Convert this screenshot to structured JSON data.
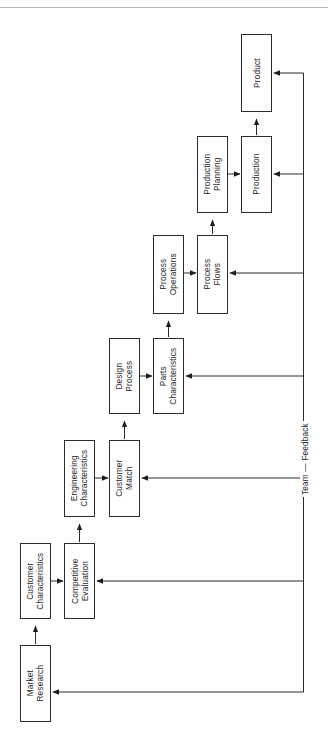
{
  "diagram": {
    "orientation": "rotated-90",
    "stroke_color": "#2b2b2b",
    "background_color": "#ffffff",
    "rule_color": "#b9b9b9",
    "nodes": [
      {
        "id": "market-research",
        "label": "Market\nResearch",
        "x": 20,
        "y": 645,
        "w": 31,
        "h": 77
      },
      {
        "id": "customer-characteristics",
        "label": "Customer\nCharacteristics",
        "x": 20,
        "y": 543,
        "w": 31,
        "h": 76
      },
      {
        "id": "competitive-evaluation",
        "label": "Competitive\nEvaluation",
        "x": 64,
        "y": 543,
        "w": 31,
        "h": 76
      },
      {
        "id": "engineering-characteristics",
        "label": "Engineering\nCharacteristics",
        "x": 64,
        "y": 440,
        "w": 31,
        "h": 77
      },
      {
        "id": "customer-match",
        "label": "Customer\nMatch",
        "x": 109,
        "y": 440,
        "w": 31,
        "h": 77
      },
      {
        "id": "design-process",
        "label": "Design\nProcess",
        "x": 109,
        "y": 338,
        "w": 31,
        "h": 76
      },
      {
        "id": "parts-characteristics",
        "label": "Parts\nCharacteristics",
        "x": 153,
        "y": 338,
        "w": 31,
        "h": 76
      },
      {
        "id": "process-operations",
        "label": "Process\nOperations",
        "x": 153,
        "y": 235,
        "w": 31,
        "h": 79
      },
      {
        "id": "process-flows",
        "label": "Process\nFlows",
        "x": 197,
        "y": 235,
        "w": 31,
        "h": 79
      },
      {
        "id": "production-planning",
        "label": "Production\nPlanning",
        "x": 197,
        "y": 136,
        "w": 31,
        "h": 77
      },
      {
        "id": "production",
        "label": "Production",
        "x": 241,
        "y": 136,
        "w": 31,
        "h": 77
      },
      {
        "id": "product",
        "label": "Product",
        "x": 241,
        "y": 34,
        "w": 31,
        "h": 78
      }
    ],
    "edge_labels": [
      {
        "id": "team-feedback",
        "label": "Team — Feedback",
        "x": 300,
        "y": 455
      }
    ],
    "edges": [
      {
        "from": "market-research",
        "to": "customer-characteristics",
        "kind": "forward-up"
      },
      {
        "from": "customer-characteristics",
        "to": "competitive-evaluation",
        "kind": "forward-right"
      },
      {
        "from": "competitive-evaluation",
        "to": "engineering-characteristics",
        "kind": "forward-up"
      },
      {
        "from": "engineering-characteristics",
        "to": "customer-match",
        "kind": "forward-right"
      },
      {
        "from": "customer-match",
        "to": "design-process",
        "kind": "forward-up"
      },
      {
        "from": "design-process",
        "to": "parts-characteristics",
        "kind": "forward-right"
      },
      {
        "from": "parts-characteristics",
        "to": "process-operations",
        "kind": "forward-up"
      },
      {
        "from": "process-operations",
        "to": "process-flows",
        "kind": "forward-right"
      },
      {
        "from": "process-flows",
        "to": "production-planning",
        "kind": "forward-up"
      },
      {
        "from": "production-planning",
        "to": "production",
        "kind": "forward-right"
      },
      {
        "from": "production",
        "to": "product",
        "kind": "forward-up"
      },
      {
        "from": "product",
        "to": "production",
        "kind": "feedback"
      },
      {
        "from": "product",
        "to": "process-flows",
        "kind": "feedback"
      },
      {
        "from": "product",
        "to": "parts-characteristics",
        "kind": "feedback"
      },
      {
        "from": "product",
        "to": "customer-match",
        "kind": "feedback"
      },
      {
        "from": "product",
        "to": "competitive-evaluation",
        "kind": "feedback"
      },
      {
        "from": "product",
        "to": "market-research",
        "kind": "feedback"
      }
    ]
  }
}
